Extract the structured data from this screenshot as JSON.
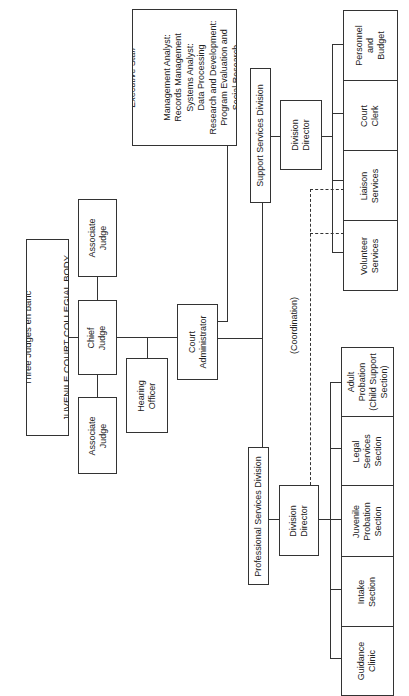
{
  "chart": {
    "orientation": "rotated -90deg",
    "collegial_body": {
      "line1": "Three Judges en banc",
      "line2": "JUVENILE COURT COLLEGIAL BODY"
    },
    "associate_judge_top": "Associate\nJudge",
    "chief_judge": "Chief\nJudge",
    "associate_judge_bottom": "Associate\nJudge",
    "hearing_officer": "Hearing\nOfficer",
    "court_administrator": "Court\nAdministrator",
    "executive_staff": {
      "title": "Executive Staff",
      "body": "Management Analyst:\nRecords Management\nSystems Analyst:\nData Processing\nResearch and Development:\nProgram Evaluation and\nSocial Research"
    },
    "support_division": {
      "title": "Support Services Division",
      "director": "Division\nDirector",
      "units": [
        {
          "label": "Personnel\nand\nBudget"
        },
        {
          "label": "Court\nClerk"
        },
        {
          "label": "Liaison\nServices"
        },
        {
          "label": "Volunteer\nServices"
        }
      ]
    },
    "professional_division": {
      "title": "Professional Services Division",
      "director": "Division\nDirector",
      "units": [
        {
          "label": "Adult\nProbation\n(Child Support\nSection)"
        },
        {
          "label": "Legal\nServices\nSection"
        },
        {
          "label": "Juvenile\nProbation\nSection"
        },
        {
          "label": "Intake\nSection"
        },
        {
          "label": "Guidance\nClinic"
        }
      ]
    },
    "coordination_label": "(Coordination)"
  },
  "colors": {
    "line": "#333333",
    "text": "#222222",
    "background": "#ffffff"
  }
}
